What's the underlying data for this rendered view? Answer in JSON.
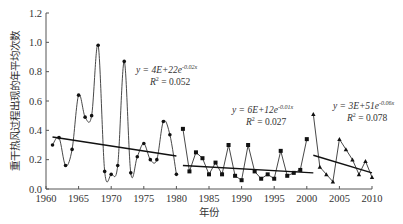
{
  "chart_data": {
    "type": "line",
    "title": "",
    "xlabel": "年份",
    "ylabel": "重干热风过程出现的年平均次数",
    "xlim": [
      1960,
      2010
    ],
    "ylim": [
      0.0,
      1.2
    ],
    "xticks": [
      1960,
      1965,
      1970,
      1975,
      1980,
      1985,
      1990,
      1995,
      2000,
      2005,
      2010
    ],
    "yticks": [
      "0.0",
      "0.2",
      "0.4",
      "0.6",
      "0.8",
      "1.0",
      "1.2"
    ],
    "grid": false,
    "series": [
      {
        "name": "1961-1980",
        "marker": "dot",
        "x": [
          1961,
          1962,
          1963,
          1964,
          1965,
          1966,
          1967,
          1968,
          1969,
          1970,
          1971,
          1972,
          1973,
          1974,
          1975,
          1976,
          1977,
          1978,
          1979,
          1980
        ],
        "values": [
          0.3,
          0.35,
          0.16,
          0.27,
          0.64,
          0.49,
          0.5,
          0.98,
          0.12,
          0.1,
          0.16,
          0.87,
          0.11,
          0.22,
          0.31,
          0.2,
          0.2,
          0.46,
          0.37,
          0.1
        ]
      },
      {
        "name": "1981-2001",
        "marker": "square",
        "x": [
          1981,
          1982,
          1983,
          1984,
          1985,
          1986,
          1987,
          1988,
          1989,
          1990,
          1991,
          1992,
          1993,
          1994,
          1995,
          1996,
          1997,
          1998,
          1999,
          2000
        ],
        "values": [
          0.41,
          0.12,
          0.25,
          0.21,
          0.1,
          0.18,
          0.1,
          0.3,
          0.09,
          0.06,
          0.3,
          0.12,
          0.07,
          0.1,
          0.07,
          0.26,
          0.09,
          0.11,
          0.13,
          0.34
        ]
      },
      {
        "name": "2001-2010",
        "marker": "triangle",
        "x": [
          2001,
          2002,
          2003,
          2004,
          2005,
          2006,
          2007,
          2008,
          2009,
          2010
        ],
        "values": [
          0.51,
          0.15,
          0.1,
          0.05,
          0.34,
          0.27,
          0.2,
          0.1,
          0.19,
          0.08
        ]
      }
    ],
    "trendlines": [
      {
        "x": [
          1961,
          1980
        ],
        "values": [
          0.355,
          0.225
        ],
        "equation": "y = 4E+22e",
        "exponent": "-0.02x",
        "r2_label": "R",
        "r2_value": "= 0.052"
      },
      {
        "x": [
          1981,
          2001
        ],
        "values": [
          0.16,
          0.11
        ],
        "equation": "y = 6E+12e",
        "exponent": "-0.01x",
        "r2_label": "R",
        "r2_value": "= 0.027"
      },
      {
        "x": [
          2001,
          2010
        ],
        "values": [
          0.23,
          0.11
        ],
        "equation": "y = 3E+51e",
        "exponent": "-0.06x",
        "r2_label": "R",
        "r2_value": "= 0.078"
      }
    ]
  }
}
